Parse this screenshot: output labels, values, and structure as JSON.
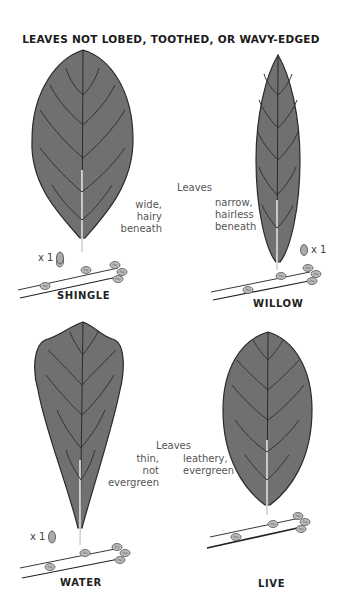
{
  "title": "LEAVES NOT LOBED, TOOTHED, OR WAVY-EDGED",
  "colors": {
    "leaf_fill": "#707070",
    "leaf_outline": "#2a2a2a",
    "vein": "#333333",
    "midrib": "#f2f2f2",
    "text": "#555555"
  },
  "species": [
    {
      "name": "SHINGLE",
      "leaf_shape": "wide-elliptic",
      "scale": "x 1",
      "traits": [
        "wide,",
        "hairy",
        "beneath"
      ]
    },
    {
      "name": "WILLOW",
      "leaf_shape": "narrow-lanceolate",
      "scale": "x 1",
      "traits": [
        "narrow,",
        "hairless",
        "beneath"
      ]
    },
    {
      "name": "WATER",
      "leaf_shape": "spatulate",
      "scale": "x 1",
      "traits": [
        "thin,",
        "not",
        "evergreen"
      ]
    },
    {
      "name": "LIVE",
      "leaf_shape": "elliptic",
      "scale": "",
      "traits": [
        "leathery,",
        "evergreen"
      ]
    }
  ],
  "group_labels": {
    "top": "Leaves",
    "bottom": "Leaves"
  }
}
